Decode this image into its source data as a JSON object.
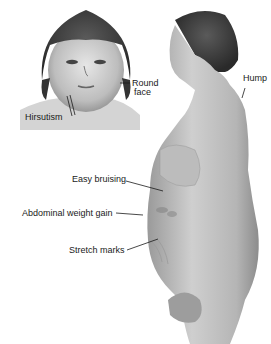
{
  "figure": {
    "style": "grayscale medical illustration",
    "colors": {
      "background": "#ffffff",
      "ink": "#1a1a1a",
      "skin_light": "#d8d8d8",
      "skin_mid": "#a8a8a8",
      "hair": "#3a3a3a"
    },
    "labels": {
      "round_face": "Round face",
      "round_face_line1": "Round",
      "round_face_line2": "face",
      "hirsutism": "Hirsutism",
      "hump": "Hump",
      "easy_bruising": "Easy bruising",
      "abdominal_weight_gain": "Abdominal weight gain",
      "stretch_marks": "Stretch marks"
    }
  }
}
